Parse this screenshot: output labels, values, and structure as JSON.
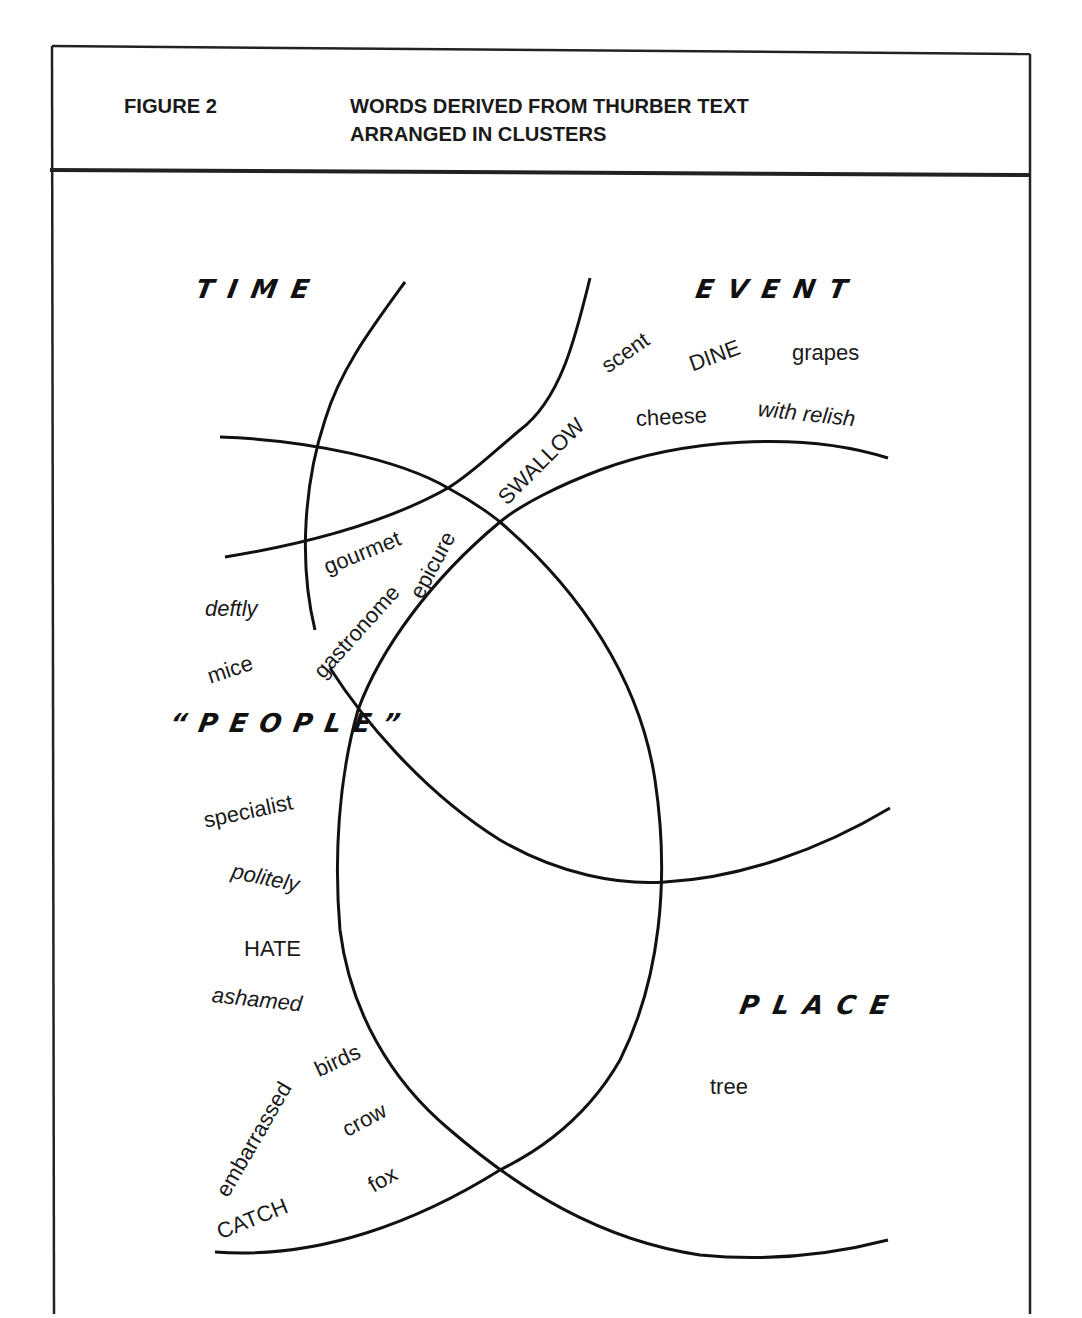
{
  "header": {
    "figure_label": "FIGURE 2",
    "title_line1": "WORDS DERIVED FROM THURBER TEXT",
    "title_line2": "ARRANGED IN CLUSTERS"
  },
  "categories": {
    "time": "TIME",
    "event": "EVENT",
    "people": "“PEOPLE”",
    "place": "PLACE"
  },
  "words": {
    "scent": "scent",
    "dine": "DINE",
    "grapes": "grapes",
    "swallow": "SWALLOW",
    "cheese": "cheese",
    "with_relish": "with relish",
    "gourmet": "gourmet",
    "epicure": "epicure",
    "gastronome": "gastronome",
    "deftly": "deftly",
    "mice": "mice",
    "specialist": "specialist",
    "politely": "politely",
    "hate": "HATE",
    "ashamed": "ashamed",
    "embarrassed": "embarrassed",
    "birds": "birds",
    "crow": "crow",
    "fox": "fox",
    "catch": "CATCH",
    "tree": "tree"
  },
  "colors": {
    "ink": "#1a1a1a",
    "paper": "#ffffff"
  }
}
